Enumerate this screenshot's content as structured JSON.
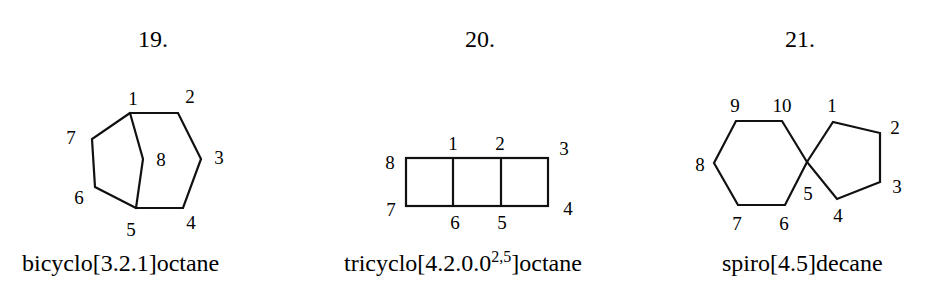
{
  "figures": [
    {
      "number": "19.",
      "name": "bicyclo[3.2.1]octane",
      "caption_prefix": "bicyclo[3.2.1]octane",
      "caption_sup": "",
      "caption_suffix": "",
      "atom_labels": [
        "1",
        "2",
        "3",
        "4",
        "5",
        "6",
        "7",
        "8"
      ]
    },
    {
      "number": "20.",
      "name": "tricyclo[4.2.0.0^2,5]octane",
      "caption_prefix": "tricyclo[4.2.0.0",
      "caption_sup": "2,5",
      "caption_suffix": "]octane",
      "atom_labels": [
        "1",
        "2",
        "3",
        "4",
        "5",
        "6",
        "7",
        "8"
      ]
    },
    {
      "number": "21.",
      "name": "spiro[4.5]decane",
      "caption_prefix": "spiro[4.5]decane",
      "caption_sup": "",
      "caption_suffix": "",
      "atom_labels": [
        "1",
        "2",
        "3",
        "4",
        "5",
        "6",
        "7",
        "8",
        "9",
        "10"
      ]
    }
  ]
}
